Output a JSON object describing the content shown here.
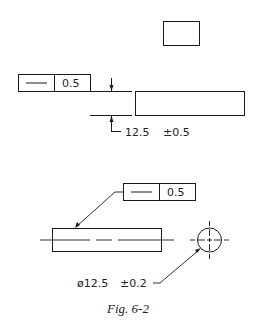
{
  "figure": {
    "caption": "Fig. 6-2",
    "top_view": {
      "frame_symbol": "straightness-icon",
      "frame_tolerance": "0.5",
      "dimension_value": "12.5",
      "dimension_tolerance": "±0.5"
    },
    "bottom_view": {
      "frame_symbol": "straightness-icon",
      "frame_tolerance": "0.5",
      "diameter_symbol": "ø",
      "diameter_value": "12.5",
      "diameter_tolerance": "±0.2"
    }
  }
}
